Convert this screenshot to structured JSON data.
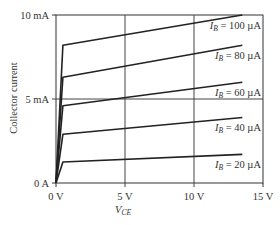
{
  "chart_data": {
    "type": "line",
    "title": "",
    "xlabel": "V_CE",
    "ylabel": "Collector current",
    "xlim": [
      0,
      15
    ],
    "ylim": [
      0,
      10
    ],
    "x_unit": "V",
    "y_unit": "mA",
    "x_ticks": [
      "0 V",
      "5 V",
      "10 V",
      "15 V"
    ],
    "y_ticks": [
      "0 A",
      "5 mA",
      "10 mA"
    ],
    "grid": true,
    "legend_position": "inline-right",
    "series": [
      {
        "name": "I_B = 100 µA",
        "label_main": "I",
        "label_sub": "B",
        "label_rest": " = 100 µA",
        "points": [
          [
            0,
            0
          ],
          [
            0.5,
            8.2
          ],
          [
            13.5,
            10.0
          ]
        ]
      },
      {
        "name": "I_B = 80 µA",
        "label_main": "I",
        "label_sub": "B",
        "label_rest": " = 80 µA",
        "points": [
          [
            0,
            0
          ],
          [
            0.5,
            6.3
          ],
          [
            13.5,
            8.2
          ]
        ]
      },
      {
        "name": "I_B = 60 µA",
        "label_main": "I",
        "label_sub": "B",
        "label_rest": " = 60 µA",
        "points": [
          [
            0,
            0
          ],
          [
            0.5,
            4.6
          ],
          [
            13.5,
            6.0
          ]
        ]
      },
      {
        "name": "I_B = 40 µA",
        "label_main": "I",
        "label_sub": "B",
        "label_rest": " = 40 µA",
        "points": [
          [
            0,
            0
          ],
          [
            0.5,
            2.9
          ],
          [
            13.5,
            3.9
          ]
        ]
      },
      {
        "name": "I_B = 20 µA",
        "label_main": "I",
        "label_sub": "B",
        "label_rest": " = 20 µA",
        "points": [
          [
            0,
            0
          ],
          [
            0.5,
            1.25
          ],
          [
            13.5,
            1.7
          ]
        ]
      }
    ]
  },
  "axis_labels": {
    "x_main": "V",
    "x_sub": "CE",
    "y": "Collector current"
  },
  "colors": {
    "curve": "#222222",
    "axis": "#333333",
    "grid": "#444444",
    "text": "#333333"
  }
}
